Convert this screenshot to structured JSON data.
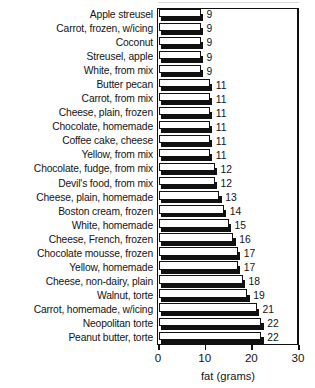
{
  "chart_data": {
    "type": "bar",
    "orientation": "horizontal",
    "title": "",
    "xlabel": "fat (grams)",
    "ylabel": "",
    "xlim": [
      0,
      30
    ],
    "xticks": [
      0,
      10,
      20,
      30
    ],
    "xtick_labels": [
      "0",
      "10",
      "20",
      "30"
    ],
    "grid": false,
    "legend": null,
    "value_labels_shown": true,
    "categories": [
      "Apple streusel",
      "Carrot, frozen, w/icing",
      "Coconut",
      "Streusel, apple",
      "White, from mix",
      "Butter pecan",
      "Carrot, from mix",
      "Cheese, plain, frozen",
      "Chocolate, homemade",
      "Coffee cake, cheese",
      "Yellow, from mix",
      "Chocolate, fudge, from mix",
      "Devil's food, from mix",
      "Cheese, plain, homemade",
      "Boston cream, frozen",
      "White, homemade",
      "Cheese, French, frozen",
      "Chocolate mousse, frozen",
      "Yellow, homemade",
      "Cheese, non-dairy, plain",
      "Walnut, torte",
      "Carrot, homemade, w/icing",
      "Neopolitan torte",
      "Peanut butter, torte"
    ],
    "values": [
      9,
      9,
      9,
      9,
      9,
      11,
      11,
      11,
      11,
      11,
      11,
      12,
      12,
      13,
      14,
      15,
      16,
      17,
      17,
      18,
      19,
      21,
      22,
      22
    ]
  },
  "colors": {
    "bar_face": "#ffffff",
    "bar_outline": "#111111",
    "bar_shadow": "#111111",
    "axis": "#111111",
    "text": "#141414",
    "background": "#ffffff"
  }
}
